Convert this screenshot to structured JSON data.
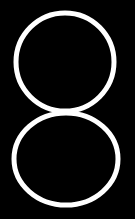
{
  "canvas": {
    "width": 135,
    "height": 219,
    "background_color": "#000000",
    "name": "figure-eight-glyph"
  },
  "figure": {
    "type": "outlined-figure-eight",
    "stroke_color": "#ffffff",
    "stroke_width": 5,
    "fill_color": "none",
    "shapes": [
      {
        "name": "upper-ellipse",
        "cx": 65,
        "cy": 62,
        "rx": 49,
        "ry": 49,
        "stroke_width": 5
      },
      {
        "name": "lower-ellipse",
        "cx": 66,
        "cy": 159,
        "rx": 52,
        "ry": 46,
        "stroke_width": 5
      }
    ],
    "tangent_point_y": 110
  }
}
